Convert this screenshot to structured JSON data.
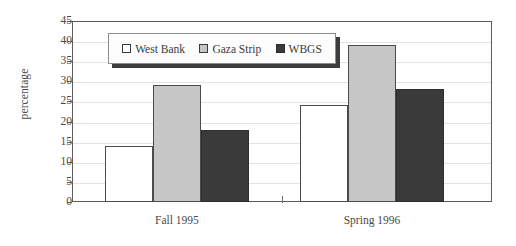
{
  "chart_data": {
    "type": "bar",
    "title": "",
    "xlabel": "",
    "ylabel": "percentage",
    "ylim": [
      0,
      45
    ],
    "ytick_step": 5,
    "yticks": [
      45,
      40,
      35,
      30,
      25,
      20,
      15,
      10,
      5,
      0
    ],
    "categories": [
      "Fall 1995",
      "Spring 1996"
    ],
    "series": [
      {
        "name": "West Bank",
        "values": [
          14,
          24
        ],
        "color": "#ffffff"
      },
      {
        "name": "Gaza Strip",
        "values": [
          29,
          39
        ],
        "color": "#c6c6c6"
      },
      {
        "name": "WBGS",
        "values": [
          18,
          28
        ],
        "color": "#3a3a3a"
      }
    ],
    "grid": true,
    "legend_position": "top-left-inside"
  },
  "colors": {
    "axis": "#5c5c5c",
    "grid": "#e2e2e2",
    "text": "#4a4a4a",
    "bar_outline": "#4b4b4b",
    "legend_shadow": "#3d3d3d"
  }
}
